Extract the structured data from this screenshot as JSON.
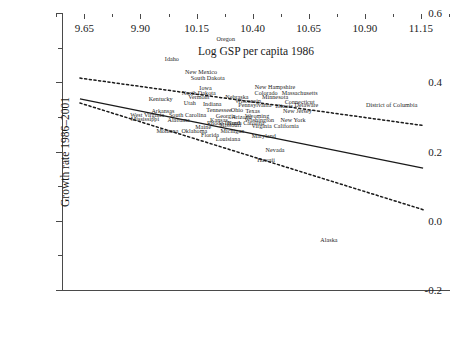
{
  "chart_data": {
    "type": "scatter",
    "title": "",
    "xlabel": "Log GSP per capita 1986",
    "ylabel": "Growth rate 1986–2001",
    "xlim": [
      9.55,
      11.28
    ],
    "ylim": [
      -0.2,
      0.6
    ],
    "xticks": [
      "9.65",
      "9.90",
      "10.15",
      "10.40",
      "10.65",
      "10.90",
      "11.15"
    ],
    "xtick_values": [
      9.65,
      9.9,
      10.15,
      10.4,
      10.65,
      10.9,
      11.15
    ],
    "yticks": [
      "0.6",
      "0.4",
      "0.2",
      "0.0",
      "-0.2"
    ],
    "ytick_values": [
      0.6,
      0.4,
      0.2,
      0.0,
      -0.2
    ],
    "grid": false,
    "legend": null,
    "point_marker": "text-label",
    "points": [
      {
        "label": "Oregon",
        "x": 10.28,
        "y": 0.525
      },
      {
        "label": "Idaho",
        "x": 10.04,
        "y": 0.468
      },
      {
        "label": "New Mexico",
        "x": 10.17,
        "y": 0.43
      },
      {
        "label": "South Dakota",
        "x": 10.2,
        "y": 0.412
      },
      {
        "label": "Iowa",
        "x": 10.19,
        "y": 0.384
      },
      {
        "label": "New Hampshire",
        "x": 10.5,
        "y": 0.385
      },
      {
        "label": "North Dakota",
        "x": 10.16,
        "y": 0.37
      },
      {
        "label": "Colorado",
        "x": 10.46,
        "y": 0.368
      },
      {
        "label": "Massachusetts",
        "x": 10.61,
        "y": 0.368
      },
      {
        "label": "Vermont",
        "x": 10.16,
        "y": 0.357
      },
      {
        "label": "Nebraska",
        "x": 10.33,
        "y": 0.357
      },
      {
        "label": "Minnesota",
        "x": 10.5,
        "y": 0.356
      },
      {
        "label": "Kentucky",
        "x": 9.99,
        "y": 0.352
      },
      {
        "label": "Wisconsin",
        "x": 10.38,
        "y": 0.345
      },
      {
        "label": "Connecticut",
        "x": 10.61,
        "y": 0.344
      },
      {
        "label": "Utah",
        "x": 10.12,
        "y": 0.339
      },
      {
        "label": "Delaware",
        "x": 10.64,
        "y": 0.333
      },
      {
        "label": "Pennsylvania",
        "x": 10.41,
        "y": 0.333
      },
      {
        "label": "Illinois",
        "x": 10.54,
        "y": 0.332
      },
      {
        "label": "Indiana",
        "x": 10.22,
        "y": 0.336
      },
      {
        "label": "Arkansas",
        "x": 10.0,
        "y": 0.318
      },
      {
        "label": "Tennessee",
        "x": 10.25,
        "y": 0.32
      },
      {
        "label": "Ohio",
        "x": 10.33,
        "y": 0.319
      },
      {
        "label": "Texas",
        "x": 10.4,
        "y": 0.318
      },
      {
        "label": "New Jersey",
        "x": 10.6,
        "y": 0.316
      },
      {
        "label": "West Virginia",
        "x": 9.93,
        "y": 0.305
      },
      {
        "label": "South Carolina",
        "x": 10.11,
        "y": 0.305
      },
      {
        "label": "Georgia",
        "x": 10.28,
        "y": 0.303
      },
      {
        "label": "Wyoming",
        "x": 10.42,
        "y": 0.302
      },
      {
        "label": "Arizona",
        "x": 10.35,
        "y": 0.3
      },
      {
        "label": "Mississippi",
        "x": 9.92,
        "y": 0.293
      },
      {
        "label": "Alabama",
        "x": 10.07,
        "y": 0.292
      },
      {
        "label": "Kansas",
        "x": 10.25,
        "y": 0.291
      },
      {
        "label": "Washington",
        "x": 10.43,
        "y": 0.291
      },
      {
        "label": "New York",
        "x": 10.58,
        "y": 0.29
      },
      {
        "label": "Rhode Island",
        "x": 10.27,
        "y": 0.283
      },
      {
        "label": "North Carolina",
        "x": 10.37,
        "y": 0.282
      },
      {
        "label": "Maine",
        "x": 10.18,
        "y": 0.272
      },
      {
        "label": "Missouri",
        "x": 10.3,
        "y": 0.276
      },
      {
        "label": "Virginia",
        "x": 10.44,
        "y": 0.274
      },
      {
        "label": "California",
        "x": 10.55,
        "y": 0.273
      },
      {
        "label": "Montana",
        "x": 10.02,
        "y": 0.258
      },
      {
        "label": "Oklahoma",
        "x": 10.14,
        "y": 0.258
      },
      {
        "label": "Michigan",
        "x": 10.31,
        "y": 0.258
      },
      {
        "label": "Florida",
        "x": 10.21,
        "y": 0.247
      },
      {
        "label": "Maryland",
        "x": 10.45,
        "y": 0.246
      },
      {
        "label": "Louisiana",
        "x": 10.29,
        "y": 0.236
      },
      {
        "label": "Nevada",
        "x": 10.5,
        "y": 0.205
      },
      {
        "label": "Hawaii",
        "x": 10.46,
        "y": 0.175
      },
      {
        "label": "Alaska",
        "x": 10.74,
        "y": -0.055
      },
      {
        "label": "District of Columbia",
        "x": 11.02,
        "y": 0.335
      }
    ],
    "fit_line": {
      "style": "solid",
      "x1": 9.63,
      "y1": 0.352,
      "x2": 11.16,
      "y2": 0.152
    },
    "confidence_bands": [
      {
        "name": "upper",
        "style": "dashed",
        "x1": 9.63,
        "y1": 0.412,
        "x2": 11.16,
        "y2": 0.275
      },
      {
        "name": "lower",
        "style": "dashed",
        "x1": 9.63,
        "y1": 0.34,
        "x2": 11.16,
        "y2": 0.032
      }
    ]
  }
}
